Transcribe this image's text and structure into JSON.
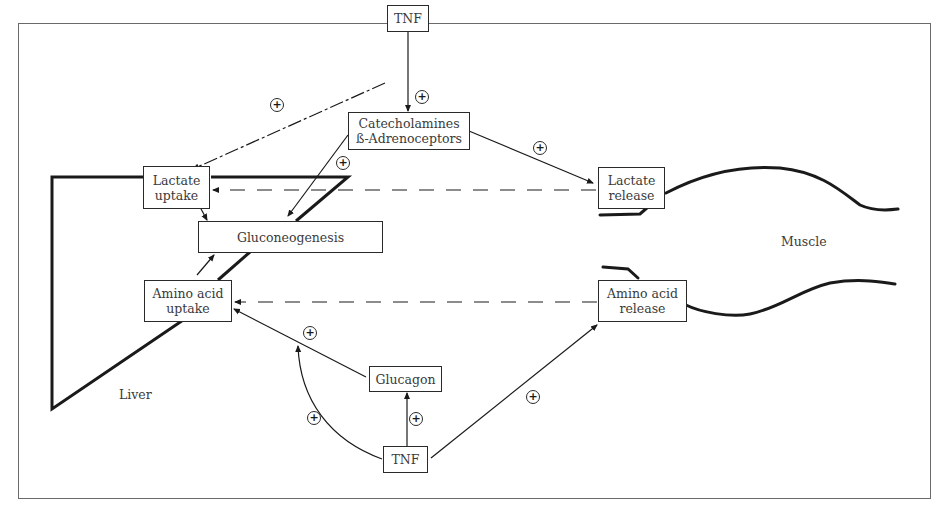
{
  "diagram": {
    "nodes": {
      "tnf_top": "TNF",
      "catecholamines_line1": "Catecholamines",
      "catecholamines_line2": "ß-Adrenoceptors",
      "lactate_uptake_line1": "Lactate",
      "lactate_uptake_line2": "uptake",
      "gluconeogenesis": "Gluconeogenesis",
      "amino_uptake_line1": "Amino acid",
      "amino_uptake_line2": "uptake",
      "lactate_release_line1": "Lactate",
      "lactate_release_line2": "release",
      "amino_release_line1": "Amino acid",
      "amino_release_line2": "release",
      "glucagon": "Glucagon",
      "tnf_bottom": "TNF"
    },
    "regions": {
      "liver": "Liver",
      "muscle": "Muscle"
    },
    "stimulation_symbol": "+",
    "edges": [
      {
        "from": "TNF (top)",
        "to": "Lactate uptake",
        "sign": "+",
        "style": "dash-dot"
      },
      {
        "from": "TNF (top)",
        "to": "Catecholamines ß-Adrenoceptors",
        "sign": "+",
        "style": "solid"
      },
      {
        "from": "Catecholamines ß-Adrenoceptors",
        "to": "Gluconeogenesis",
        "sign": "+",
        "style": "solid"
      },
      {
        "from": "Catecholamines ß-Adrenoceptors",
        "to": "Lactate release",
        "sign": "+",
        "style": "solid"
      },
      {
        "from": "Lactate release",
        "to": "Lactate uptake",
        "style": "dashed"
      },
      {
        "from": "Lactate uptake",
        "to": "Gluconeogenesis",
        "style": "solid"
      },
      {
        "from": "Amino acid uptake",
        "to": "Gluconeogenesis",
        "style": "solid"
      },
      {
        "from": "Amino acid release",
        "to": "Amino acid uptake",
        "style": "dashed"
      },
      {
        "from": "Glucagon",
        "to": "Amino acid uptake",
        "sign": "+",
        "style": "solid"
      },
      {
        "from": "TNF (bottom)",
        "to": "Glucagon",
        "sign": "+",
        "style": "solid"
      },
      {
        "from": "TNF (bottom)",
        "to": "Amino acid uptake",
        "sign": "+",
        "style": "solid-curve"
      },
      {
        "from": "TNF (bottom)",
        "to": "Amino acid release",
        "sign": "+",
        "style": "solid"
      }
    ]
  }
}
